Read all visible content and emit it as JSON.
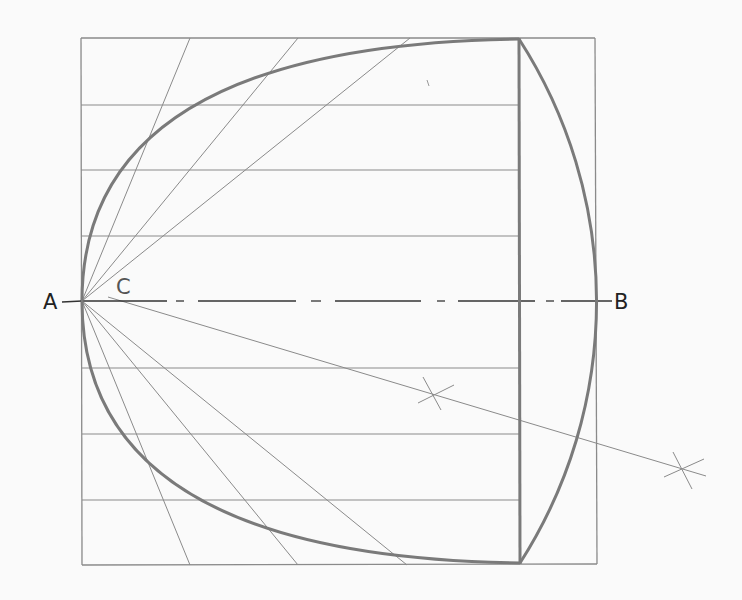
{
  "diagram": {
    "labels": {
      "a": "A",
      "b": "B",
      "c": "C"
    },
    "colors": {
      "background": "#fafafa",
      "thin_line": "#8a8a8a",
      "thick_line": "#7a7a7a",
      "axis_line": "#333333",
      "text": "#222222"
    },
    "frame": {
      "x1": 81,
      "y1": 38,
      "x2": 596,
      "y2": 564
    },
    "axis": {
      "y": 301,
      "x1": 82,
      "x2": 612
    },
    "vertex_a": {
      "x": 82,
      "y": 301
    },
    "center_c": {
      "x": 112,
      "y": 301
    },
    "chord_x": 519,
    "horizontal_lines_y": [
      105,
      170,
      236,
      368,
      434,
      500
    ],
    "rays_top_x": [
      190,
      298,
      410
    ],
    "rays_bottom_x": [
      190,
      298,
      407
    ],
    "parabola_points_upper": [
      [
        82,
        301
      ],
      [
        111,
        236
      ],
      [
        195,
        170
      ],
      [
        327,
        105
      ],
      [
        519,
        39
      ]
    ],
    "parabola_points_lower": [
      [
        82,
        301
      ],
      [
        111,
        368
      ],
      [
        195,
        434
      ],
      [
        327,
        500
      ],
      [
        519,
        563
      ]
    ],
    "bisector": {
      "from": {
        "x": 108,
        "y": 297
      },
      "to": {
        "x": 706,
        "y": 476
      },
      "cross_marks": [
        {
          "x": 431,
          "y": 394
        },
        {
          "x": 683,
          "y": 469
        }
      ]
    }
  }
}
